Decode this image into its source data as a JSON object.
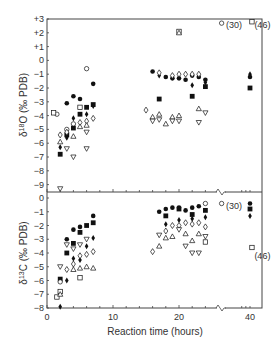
{
  "chart_data": [
    {
      "type": "scatter",
      "panel": "top",
      "ylabel": "δ18O (‰ PDB)",
      "ylabel_parts": {
        "delta": "δ",
        "sup": "18",
        "rest": "O (‰ PDB)"
      },
      "ylim": [
        -9.5,
        3
      ],
      "yticks": [
        3,
        2,
        1,
        0,
        -1,
        -2,
        -3,
        -4,
        -5,
        -6,
        -7,
        -8,
        -9
      ],
      "ytick_labels": [
        "+3",
        "+2",
        "+1",
        "0",
        "−1",
        "−2",
        "−3",
        "−4",
        "−5",
        "−6",
        "−7",
        "−8",
        "−9"
      ],
      "xlim": [
        0,
        42
      ],
      "axis_break_at_x": 26,
      "annotations": [
        {
          "text": "(30)",
          "x": 26.5,
          "y": 2.7,
          "marker": "open_circle"
        },
        {
          "text": "(46)",
          "x": 40.3,
          "y": 2.7,
          "marker": "open_square"
        }
      ],
      "series": [
        {
          "name": "filled circle",
          "marker": "filled_circle",
          "points": [
            [
              3,
              -3.1
            ],
            [
              4,
              -2.6
            ],
            [
              5,
              -2.8
            ],
            [
              7,
              -1.7
            ],
            [
              16,
              -0.8
            ],
            [
              18,
              -1.2
            ],
            [
              19,
              -1.3
            ],
            [
              20,
              -1.3
            ],
            [
              21,
              -1.4
            ],
            [
              22,
              -1.1
            ],
            [
              23,
              -1.2
            ],
            [
              24,
              -1.4
            ],
            [
              40,
              -1.2
            ]
          ]
        },
        {
          "name": "filled square",
          "marker": "filled_square",
          "points": [
            [
              2,
              -6.8
            ],
            [
              3,
              -5.4
            ],
            [
              4,
              -4.9
            ],
            [
              5,
              -3.9
            ],
            [
              6,
              -3.4
            ],
            [
              7,
              -3.2
            ],
            [
              17,
              -2.8
            ],
            [
              22,
              -2.6
            ],
            [
              24,
              -1.9
            ],
            [
              40,
              -2
            ]
          ]
        },
        {
          "name": "filled diamond",
          "marker": "filled_diamond",
          "points": [
            [
              2,
              -6.3
            ],
            [
              3,
              -5.6
            ],
            [
              4,
              -4.2
            ],
            [
              6,
              -3.9
            ],
            [
              7,
              -3.3
            ],
            [
              17,
              -1.1
            ],
            [
              22,
              -1.8
            ],
            [
              24,
              -1.6
            ],
            [
              40,
              -1.0
            ]
          ]
        },
        {
          "name": "open circle",
          "marker": "open_circle",
          "points": [
            [
              1.5,
              -3.9
            ],
            [
              3,
              -5
            ],
            [
              4,
              -4.6
            ],
            [
              6,
              -0.6
            ],
            [
              30,
              2.7
            ]
          ]
        },
        {
          "name": "open square",
          "marker": "open_square",
          "points": [
            [
              1,
              -3.8
            ],
            [
              5,
              -3.4
            ],
            [
              20,
              2.1
            ],
            [
              46,
              2.8
            ]
          ]
        },
        {
          "name": "open diamond",
          "marker": "open_diamond",
          "points": [
            [
              2,
              -5.4
            ],
            [
              3,
              -5.2
            ],
            [
              5,
              -4.5
            ],
            [
              6,
              -4.4
            ],
            [
              7,
              -4.2
            ],
            [
              15,
              -3.6
            ],
            [
              17,
              -0.9
            ],
            [
              19,
              -1.1
            ],
            [
              20,
              -1.0
            ],
            [
              21,
              -1.0
            ],
            [
              22,
              -1.0
            ],
            [
              23,
              -1.0
            ]
          ]
        },
        {
          "name": "open triangle up",
          "marker": "open_triangle_up",
          "points": [
            [
              2,
              -5.9
            ],
            [
              4,
              -5.5
            ],
            [
              5,
              -4.8
            ],
            [
              6,
              -4.7
            ],
            [
              16,
              -4.1
            ],
            [
              17,
              -3.9
            ],
            [
              18,
              -4.6
            ],
            [
              19,
              -4.1
            ],
            [
              20,
              -4.0
            ],
            [
              23,
              -3.5
            ],
            [
              20,
              2.0
            ]
          ]
        },
        {
          "name": "open triangle down",
          "marker": "open_triangle_down",
          "points": [
            [
              2,
              -9.3
            ],
            [
              3,
              -6.4
            ],
            [
              4,
              -7.0
            ],
            [
              6,
              -6.4
            ],
            [
              6,
              -5.2
            ],
            [
              16,
              -4.4
            ],
            [
              17,
              -4.3
            ],
            [
              19,
              -4.4
            ],
            [
              20,
              -4.4
            ],
            [
              23,
              -4.5
            ],
            [
              24,
              -3.8
            ]
          ]
        }
      ]
    },
    {
      "type": "scatter",
      "panel": "bottom",
      "ylabel": "δ13C (‰ PDB)",
      "ylabel_parts": {
        "delta": "δ",
        "sup": "13",
        "rest": "C (‰ PDB)"
      },
      "xlabel": "Reaction time (hours)",
      "ylim": [
        -8,
        0.3
      ],
      "yticks": [
        0,
        -1,
        -2,
        -3,
        -4,
        -5,
        -6,
        -7,
        -8
      ],
      "ytick_labels": [
        "0",
        "−1",
        "−2",
        "−3",
        "−4",
        "−5",
        "−6",
        "−7",
        "−8"
      ],
      "xticks": [
        0,
        10,
        20,
        40
      ],
      "xtick_labels": [
        "0",
        "10",
        "20",
        "40"
      ],
      "xlim": [
        0,
        42
      ],
      "axis_break_at_x": 26,
      "annotations": [
        {
          "text": "(30)",
          "x": 26.5,
          "y": -0.4,
          "marker": "open_circle"
        },
        {
          "text": "(46)",
          "x": 40.3,
          "y": -4.1,
          "marker": "open_square"
        }
      ],
      "series": [
        {
          "name": "filled circle",
          "marker": "filled_circle",
          "points": [
            [
              3,
              -3
            ],
            [
              4,
              -2.3
            ],
            [
              5,
              -2.1
            ],
            [
              7,
              -1.3
            ],
            [
              17,
              -1
            ],
            [
              18,
              -0.8
            ],
            [
              19,
              -0.7
            ],
            [
              20,
              -0.7
            ],
            [
              21,
              -0.9
            ],
            [
              22,
              -0.7
            ],
            [
              23,
              -0.6
            ],
            [
              40,
              -0.4
            ]
          ]
        },
        {
          "name": "filled square",
          "marker": "filled_square",
          "points": [
            [
              2,
              -5.9
            ],
            [
              3,
              -4
            ],
            [
              4,
              -3.3
            ],
            [
              5,
              -2.5
            ],
            [
              6,
              -2
            ],
            [
              7,
              -1.8
            ],
            [
              18,
              -1.3
            ],
            [
              20,
              -0.8
            ],
            [
              22,
              -1.2
            ],
            [
              24,
              -0.9
            ],
            [
              40,
              -0.8
            ]
          ]
        },
        {
          "name": "filled diamond",
          "marker": "filled_diamond",
          "points": [
            [
              2,
              -7.9
            ],
            [
              3,
              -6
            ],
            [
              4,
              -4.4
            ],
            [
              5,
              -4.5
            ],
            [
              6,
              -3.5
            ],
            [
              7,
              -2.9
            ],
            [
              18,
              -1.9
            ],
            [
              20,
              -1.6
            ],
            [
              22,
              -1.5
            ],
            [
              24,
              -1.4
            ],
            [
              40,
              -1.3
            ]
          ]
        },
        {
          "name": "open circle",
          "marker": "open_circle",
          "points": [
            [
              2,
              -6.1
            ],
            [
              24,
              -0.4
            ],
            [
              30,
              -0.4
            ]
          ]
        },
        {
          "name": "open square",
          "marker": "open_square",
          "points": [
            [
              1.5,
              -7.2
            ],
            [
              2,
              -6.8
            ],
            [
              5,
              -5.8
            ],
            [
              24,
              -3.2
            ],
            [
              46,
              -3.6
            ]
          ]
        },
        {
          "name": "open diamond",
          "marker": "open_diamond",
          "points": [
            [
              3,
              -5.2
            ],
            [
              4,
              -4.8
            ],
            [
              5,
              -4.2
            ],
            [
              6,
              -4.1
            ],
            [
              7,
              -3.9
            ],
            [
              16,
              -3.9
            ],
            [
              18,
              -2.4
            ],
            [
              19,
              -2
            ],
            [
              20,
              -2
            ],
            [
              21,
              -1.8
            ],
            [
              22,
              -1.9
            ],
            [
              23,
              -1.8
            ],
            [
              24,
              -2.1
            ]
          ]
        },
        {
          "name": "open triangle up",
          "marker": "open_triangle_up",
          "points": [
            [
              2,
              -7
            ],
            [
              4,
              -5.2
            ],
            [
              5,
              -5.1
            ],
            [
              6,
              -5
            ],
            [
              7,
              -5.1
            ],
            [
              17,
              -3.5
            ],
            [
              18,
              -2.9
            ],
            [
              19,
              -2.8
            ],
            [
              21,
              -2.6
            ],
            [
              22,
              -3.1
            ],
            [
              23,
              -2.6
            ]
          ]
        },
        {
          "name": "open triangle down",
          "marker": "open_triangle_down",
          "points": [
            [
              2,
              -5
            ],
            [
              3,
              -3.4
            ],
            [
              4,
              -3.7
            ],
            [
              5,
              -3.4
            ],
            [
              6,
              -3
            ],
            [
              17,
              -2.7
            ],
            [
              20,
              -2.3
            ],
            [
              21,
              -3.5
            ],
            [
              22,
              -4
            ],
            [
              23,
              -4
            ],
            [
              24,
              -2.8
            ]
          ]
        }
      ]
    }
  ]
}
